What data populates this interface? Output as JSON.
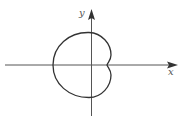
{
  "figure": {
    "type": "polar-curve",
    "axes": {
      "x_label": "x",
      "y_label": "y"
    },
    "colors": {
      "axis": "#555555",
      "curve": "#333333",
      "background": "#ffffff"
    }
  }
}
